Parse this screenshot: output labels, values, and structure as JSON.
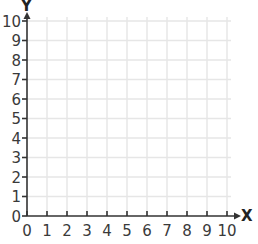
{
  "chart_data": {
    "type": "scatter",
    "title": "",
    "xlabel": "X",
    "ylabel": "Y",
    "xlim": [
      0,
      10
    ],
    "ylim": [
      0,
      10
    ],
    "x_ticks": [
      "0",
      "1",
      "2",
      "3",
      "4",
      "5",
      "6",
      "7",
      "8",
      "9",
      "10"
    ],
    "y_ticks": [
      "0",
      "1",
      "2",
      "3",
      "4",
      "5",
      "6",
      "7",
      "8",
      "9",
      "10"
    ],
    "grid": true,
    "series": [],
    "legend": null
  },
  "colors": {
    "axis": "#333333",
    "grid": "#e6e6e6",
    "text": "#3a3a3a"
  }
}
